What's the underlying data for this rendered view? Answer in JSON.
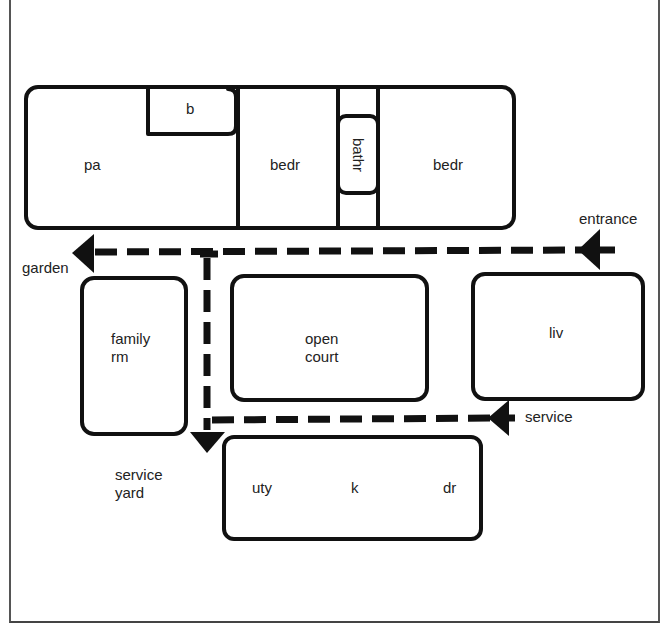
{
  "diagram": {
    "type": "floor-plan-circulation",
    "colors": {
      "line": "#111111",
      "text": "#222222",
      "background": "#ffffff"
    },
    "rooms": {
      "pa": "pa",
      "b": "b",
      "bedr1": "bedr",
      "bathr": "bathr",
      "bedr2": "bedr",
      "family_rm": "family\nrm",
      "open_court": "open\ncourt",
      "liv": "liv",
      "uty": "uty",
      "k": "k",
      "dr": "dr"
    },
    "labels": {
      "entrance": "entrance",
      "garden": "garden",
      "service": "service",
      "service_yard": "service\nyard"
    },
    "arrows": [
      {
        "name": "entrance-to-garden",
        "from": "entrance",
        "to": "garden",
        "style": "dashed"
      },
      {
        "name": "service-path",
        "from": "service",
        "to": "service yard",
        "style": "dashed"
      },
      {
        "name": "connector-to-service-yard",
        "from": "main corridor",
        "to": "service yard",
        "style": "dashed"
      }
    ]
  }
}
